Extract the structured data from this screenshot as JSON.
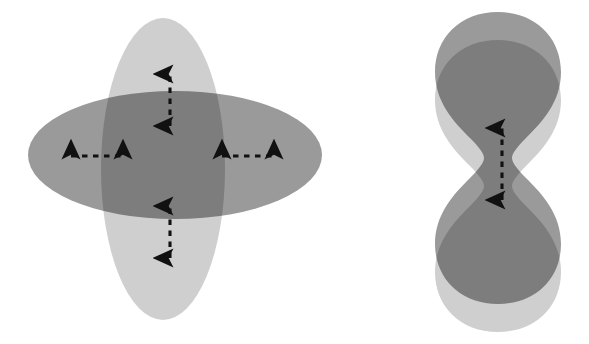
{
  "figure": {
    "background_color": "#ffffff",
    "width": 589,
    "height": 344,
    "colors": {
      "light_gray": "#cfcfcf",
      "medium_gray": "#9a9a9a",
      "dark_overlap_gray": "#6e6e6e",
      "arrow_color": "#111111"
    },
    "panels": [
      {
        "id": "left-panel",
        "name": "crossed-ellipse-pair",
        "description": "A tall light-gray vertical ellipse crossed by a wider medium-gray horizontal ellipse; their intersection renders as a dark gray rounded square.",
        "shapes": [
          {
            "name": "vertical-ellipse",
            "shape": "ellipse",
            "fill": "#cfcfcf",
            "center_x": 163,
            "center_y": 169,
            "radius_x": 62,
            "radius_y": 151
          },
          {
            "name": "horizontal-ellipse",
            "shape": "ellipse",
            "fill": "#9a9a9a",
            "center_x": 175,
            "center_y": 155,
            "radius_x": 147,
            "radius_y": 64
          }
        ],
        "arrows": [
          {
            "name": "arrow-top",
            "orientation": "vertical",
            "style": "double-headed-dashed",
            "x": 170,
            "y1": 74,
            "y2": 126
          },
          {
            "name": "arrow-bottom",
            "orientation": "vertical",
            "style": "double-headed-dashed",
            "x": 170,
            "y1": 206,
            "y2": 258
          },
          {
            "name": "arrow-left",
            "orientation": "horizontal",
            "style": "double-headed-dashed",
            "y": 156,
            "x1": 71,
            "x2": 123
          },
          {
            "name": "arrow-right",
            "orientation": "horizontal",
            "style": "double-headed-dashed",
            "y": 156,
            "x1": 222,
            "x2": 274
          }
        ]
      },
      {
        "id": "right-panel",
        "name": "overlapping-dumbbell-pair",
        "description": "Two peanut / dumbbell shaped lobes, a dark gray one shifted upward and a light gray one shifted downward, overlapping in the middle.",
        "shapes": [
          {
            "name": "dumbbell-light",
            "shape": "dumbbell",
            "fill": "#cfcfcf",
            "center_x": 498,
            "center_y": 186,
            "half_width": 63,
            "half_height": 146
          },
          {
            "name": "dumbbell-dark",
            "shape": "dumbbell",
            "fill": "#9a9a9a",
            "center_x": 498,
            "center_y": 158,
            "half_width": 63,
            "half_height": 146
          }
        ],
        "arrows": [
          {
            "name": "arrow-center",
            "orientation": "vertical",
            "style": "double-headed-dashed",
            "x": 502,
            "y1": 128,
            "y2": 200
          }
        ]
      }
    ]
  }
}
